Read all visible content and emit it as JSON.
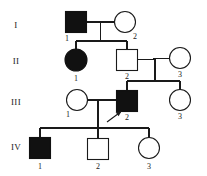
{
  "figure": {
    "type": "pedigree-chart",
    "title": "",
    "width": 207,
    "height": 176,
    "background_color": "#ffffff",
    "line_color": "#1a1a1a",
    "affected_fill_color": "#111111",
    "unaffected_fill_color": "#ffffff"
  },
  "legend_semantics": {
    "square": "male",
    "circle": "female",
    "filled": "affected",
    "open": "unaffected",
    "arrow": "proband"
  },
  "generations": [
    {
      "key": "I",
      "label": "I",
      "label_x": 16,
      "label_y": 28
    },
    {
      "key": "II",
      "label": "II",
      "label_x": 14,
      "label_y": 64
    },
    {
      "key": "III",
      "label": "III",
      "label_x": 12,
      "label_y": 105
    },
    {
      "key": "IV",
      "label": "IV",
      "label_x": 12,
      "label_y": 150
    }
  ],
  "individuals": [
    {
      "id": "I-1",
      "generation": "I",
      "number": "1",
      "sex": "male",
      "shape": "square",
      "affected": true,
      "cx": 76,
      "cy": 22,
      "size": 21,
      "num_x": 67,
      "num_y": 41
    },
    {
      "id": "I-2",
      "generation": "I",
      "number": "2",
      "sex": "female",
      "shape": "circle",
      "affected": false,
      "cx": 125,
      "cy": 22,
      "r": 10.5,
      "num_x": 134,
      "num_y": 39
    },
    {
      "id": "II-1",
      "generation": "II",
      "number": "1",
      "sex": "female",
      "shape": "circle",
      "affected": true,
      "cx": 76,
      "cy": 60,
      "r": 11,
      "num_x": 73,
      "num_y": 80
    },
    {
      "id": "II-2",
      "generation": "II",
      "number": "2",
      "sex": "male",
      "shape": "square",
      "affected": false,
      "cx": 127,
      "cy": 60,
      "size": 21,
      "num_x": 124,
      "num_y": 79
    },
    {
      "id": "II-3",
      "generation": "II",
      "number": "3",
      "sex": "female",
      "shape": "circle",
      "affected": false,
      "cx": 180,
      "cy": 58,
      "r": 10.5,
      "num_x": 177,
      "num_y": 77
    },
    {
      "id": "III-1",
      "generation": "III",
      "number": "1",
      "sex": "female",
      "shape": "circle",
      "affected": false,
      "cx": 77,
      "cy": 99,
      "r": 10.5,
      "num_x": 66,
      "num_y": 117
    },
    {
      "id": "III-2",
      "generation": "III",
      "number": "2",
      "sex": "male",
      "shape": "square",
      "affected": true,
      "cx": 127,
      "cy": 101,
      "size": 21,
      "num_x": 124,
      "num_y": 120
    },
    {
      "id": "III-3",
      "generation": "III",
      "number": "3",
      "sex": "female",
      "shape": "circle",
      "affected": false,
      "cx": 180,
      "cy": 100,
      "r": 10.5,
      "num_x": 177,
      "num_y": 119
    },
    {
      "id": "IV-1",
      "generation": "IV",
      "number": "1",
      "sex": "male",
      "shape": "square",
      "affected": true,
      "cx": 40,
      "cy": 148,
      "size": 21,
      "num_x": 37,
      "num_y": 168
    },
    {
      "id": "IV-2",
      "generation": "IV",
      "number": "2",
      "sex": "male",
      "shape": "square",
      "affected": false,
      "cx": 98,
      "cy": 149,
      "size": 21,
      "num_x": 95,
      "num_y": 168
    },
    {
      "id": "IV-3",
      "generation": "IV",
      "number": "3",
      "sex": "female",
      "shape": "circle",
      "affected": false,
      "cx": 149,
      "cy": 148,
      "r": 10.5,
      "num_x": 146,
      "num_y": 168
    }
  ],
  "matings": [
    {
      "id": "mating-I",
      "partners": [
        "I-1",
        "I-2"
      ],
      "children": [
        "II-1",
        "II-2"
      ]
    },
    {
      "id": "mating-II",
      "partners": [
        "II-2",
        "II-3"
      ],
      "children": [
        "III-2",
        "III-3"
      ]
    },
    {
      "id": "mating-III",
      "partners": [
        "III-1",
        "III-2"
      ],
      "children": [
        "IV-1",
        "IV-2",
        "IV-3"
      ]
    }
  ],
  "proband": {
    "individual_id": "III-2",
    "arrow_tail_x": 108,
    "arrow_tail_y": 121,
    "arrow_tip_x": 120,
    "arrow_tip_y": 112
  }
}
